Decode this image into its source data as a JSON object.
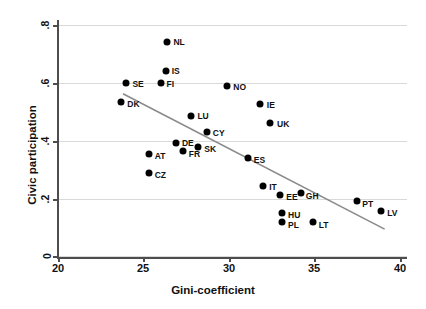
{
  "chart_data": {
    "type": "scatter",
    "title": "",
    "xlabel": "Gini-coefficient",
    "ylabel": "Civic participation",
    "xlim": [
      20,
      40
    ],
    "ylim": [
      0,
      0.8
    ],
    "xticks": [
      "20",
      "25",
      "30",
      "35",
      "40"
    ],
    "xtick_values": [
      20,
      25,
      30,
      35,
      40
    ],
    "yticks": [
      "0",
      ".2",
      ".4",
      ".6",
      ".8"
    ],
    "ytick_values": [
      0,
      0.2,
      0.4,
      0.6,
      0.8
    ],
    "grid": "horizontal",
    "legend": "none",
    "marker": "filled-circle-black",
    "points": [
      {
        "label": "SE",
        "x": 24.0,
        "y": 0.6,
        "lx": 6,
        "ly": 1
      },
      {
        "label": "DK",
        "x": 23.7,
        "y": 0.532,
        "lx": 6,
        "ly": 2
      },
      {
        "label": "NL",
        "x": 26.4,
        "y": 0.74,
        "lx": 6,
        "ly": 0
      },
      {
        "label": "IS",
        "x": 26.3,
        "y": 0.64,
        "lx": 6,
        "ly": 0
      },
      {
        "label": "FI",
        "x": 26.0,
        "y": 0.6,
        "lx": 6,
        "ly": 1
      },
      {
        "label": "NO",
        "x": 29.9,
        "y": 0.59,
        "lx": 6,
        "ly": 1
      },
      {
        "label": "IE",
        "x": 31.8,
        "y": 0.528,
        "lx": 7,
        "ly": 1
      },
      {
        "label": "UK",
        "x": 32.4,
        "y": 0.462,
        "lx": 7,
        "ly": 1
      },
      {
        "label": "LU",
        "x": 27.8,
        "y": 0.486,
        "lx": 6,
        "ly": 0
      },
      {
        "label": "CY",
        "x": 28.7,
        "y": 0.428,
        "lx": 6,
        "ly": 1
      },
      {
        "label": "DE",
        "x": 26.9,
        "y": 0.39,
        "lx": 6,
        "ly": 0
      },
      {
        "label": "SK",
        "x": 28.2,
        "y": 0.376,
        "lx": 6,
        "ly": 2
      },
      {
        "label": "FR",
        "x": 27.3,
        "y": 0.362,
        "lx": 6,
        "ly": 3
      },
      {
        "label": "ES",
        "x": 31.1,
        "y": 0.338,
        "lx": 6,
        "ly": 2
      },
      {
        "label": "AT",
        "x": 25.3,
        "y": 0.352,
        "lx": 6,
        "ly": 2
      },
      {
        "label": "CZ",
        "x": 25.3,
        "y": 0.287,
        "lx": 6,
        "ly": 2
      },
      {
        "label": "IT",
        "x": 32.0,
        "y": 0.242,
        "lx": 6,
        "ly": 1
      },
      {
        "label": "EE",
        "x": 33.0,
        "y": 0.21,
        "lx": 6,
        "ly": 2
      },
      {
        "label": "GH",
        "x": 34.2,
        "y": 0.218,
        "lx": 5,
        "ly": 3
      },
      {
        "label": "PT",
        "x": 37.5,
        "y": 0.19,
        "lx": 5,
        "ly": 3
      },
      {
        "label": "LV",
        "x": 38.9,
        "y": 0.155,
        "lx": 6,
        "ly": 2
      },
      {
        "label": "HU",
        "x": 33.1,
        "y": 0.148,
        "lx": 6,
        "ly": 2
      },
      {
        "label": "PL",
        "x": 33.1,
        "y": 0.118,
        "lx": 6,
        "ly": 3
      },
      {
        "label": "LT",
        "x": 34.9,
        "y": 0.118,
        "lx": 6,
        "ly": 3
      }
    ],
    "fit_line": {
      "type": "linear-fit",
      "x_start": 23.8,
      "y_start": 0.562,
      "x_end": 39.1,
      "y_end": 0.093,
      "color": "#8a8a8a"
    }
  }
}
